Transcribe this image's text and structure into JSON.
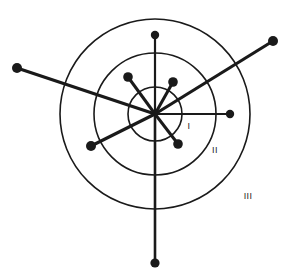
{
  "figure": {
    "background_color": "#ffffff",
    "stroke_color": "#1a1a1a",
    "width": 289,
    "height": 272
  },
  "chart_data": {
    "type": "scatter",
    "title": "",
    "subtitle": "",
    "xlabel": "",
    "ylabel": "",
    "grid": false,
    "legend_position": "none",
    "coordinate_system": "polar-radial",
    "center": {
      "x": 155,
      "y": 114
    },
    "annotations": [
      {
        "name": "zone-label-1",
        "text": "I",
        "x": 189,
        "y": 127
      },
      {
        "name": "zone-label-2",
        "text": "II",
        "x": 215,
        "y": 151
      },
      {
        "name": "zone-label-3",
        "text": "III",
        "x": 248,
        "y": 197
      }
    ],
    "rings": [
      {
        "name": "inner-ring",
        "label": "I",
        "radius": 27,
        "stroke_width": 1.6
      },
      {
        "name": "middle-ring",
        "label": "II",
        "radius": 61,
        "stroke_width": 1.6
      },
      {
        "name": "outer-ring",
        "label": "III",
        "radius": 95,
        "stroke_width": 1.6
      }
    ],
    "rays": [
      {
        "name": "ray-north",
        "direction": "north",
        "angle_deg": 90,
        "length": 79,
        "zone": "III",
        "stroke_width": 2.2,
        "endpoint": {
          "x": 155,
          "y": 35
        },
        "dot_radius": 4.2
      },
      {
        "name": "ray-south",
        "direction": "south",
        "angle_deg": 270,
        "length": 149,
        "zone": "beyond-III",
        "stroke_width": 2.6,
        "endpoint": {
          "x": 155,
          "y": 263
        },
        "dot_radius": 4.6
      },
      {
        "name": "ray-east",
        "direction": "east",
        "angle_deg": 0,
        "length": 75,
        "zone": "III",
        "stroke_width": 2.2,
        "endpoint": {
          "x": 230,
          "y": 114
        },
        "dot_radius": 4.2
      },
      {
        "name": "ray-northwest-long",
        "direction": "west-northwest",
        "angle_deg": 163,
        "length": 144,
        "zone": "beyond-III",
        "stroke_width": 3.2,
        "endpoint": {
          "x": 17,
          "y": 68
        },
        "dot_radius": 5.0
      },
      {
        "name": "ray-northeast-long",
        "direction": "east-northeast",
        "angle_deg": 31,
        "length": 138,
        "zone": "beyond-III",
        "stroke_width": 3.2,
        "endpoint": {
          "x": 273,
          "y": 41
        },
        "dot_radius": 5.0
      },
      {
        "name": "ray-southwest-medium",
        "direction": "west-southwest",
        "angle_deg": 207,
        "length": 72,
        "zone": "III",
        "stroke_width": 3.2,
        "endpoint": {
          "x": 91,
          "y": 146
        },
        "dot_radius": 5.0
      },
      {
        "name": "ray-northwest-short",
        "direction": "north-northwest",
        "angle_deg": 118,
        "length": 43,
        "zone": "II",
        "stroke_width": 3.0,
        "endpoint": {
          "x": 128,
          "y": 77
        },
        "dot_radius": 4.8
      },
      {
        "name": "ray-northeast-short",
        "direction": "north-northeast",
        "angle_deg": 60,
        "length": 37,
        "zone": "II",
        "stroke_width": 3.0,
        "endpoint": {
          "x": 173,
          "y": 82
        },
        "dot_radius": 4.8
      },
      {
        "name": "ray-southeast-short",
        "direction": "south-southeast",
        "angle_deg": 313,
        "length": 38,
        "zone": "II",
        "stroke_width": 3.0,
        "endpoint": {
          "x": 178,
          "y": 144
        },
        "dot_radius": 4.8
      }
    ]
  }
}
